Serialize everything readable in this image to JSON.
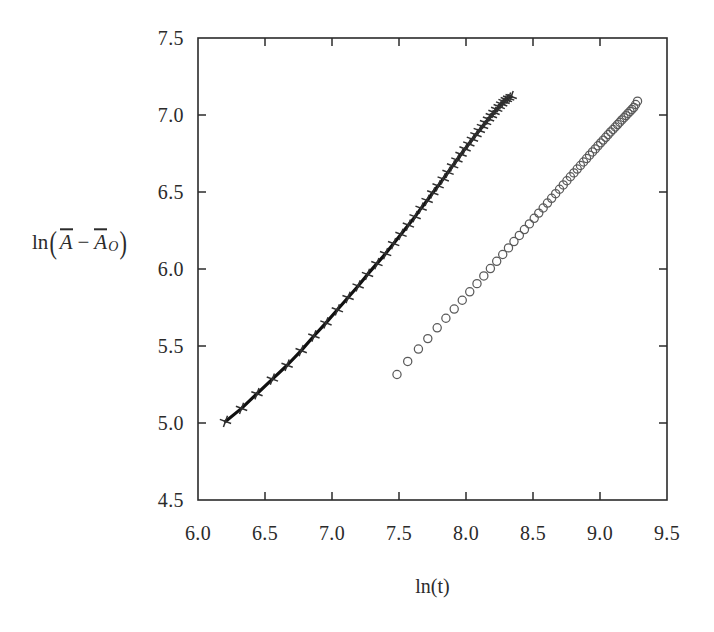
{
  "axis_labels": {
    "x_title": "ln(t)",
    "y_title_parts": {
      "fn": "ln",
      "open": "(",
      "var1": "A",
      "operator": "−",
      "var2": "A",
      "var2_sub": "O",
      "close": ")"
    },
    "y_title_plain": "ln(Ā − Ā_O)"
  },
  "chart_data": {
    "type": "scatter",
    "title": "",
    "xlabel": "ln(t)",
    "ylabel": "ln(Ā − Ā_O)",
    "xlim": [
      6.0,
      9.5
    ],
    "ylim": [
      4.5,
      7.5
    ],
    "xticks": [
      6.0,
      6.5,
      7.0,
      7.5,
      8.0,
      8.5,
      9.0,
      9.5
    ],
    "yticks": [
      4.5,
      5.0,
      5.5,
      6.0,
      6.5,
      7.0,
      7.5
    ],
    "xtick_labels": [
      "6.0",
      "6.5",
      "7.0",
      "7.5",
      "8.0",
      "8.5",
      "9.0",
      "9.5"
    ],
    "ytick_labels": [
      "4.5",
      "5.0",
      "5.5",
      "6.0",
      "6.5",
      "7.0",
      "7.5"
    ],
    "grid": false,
    "legend": "none",
    "frame": "box",
    "tick_direction": "in",
    "series": [
      {
        "name": "cross-series",
        "marker": "cross",
        "marker_color": "#303030",
        "line": "solid",
        "line_color": "#101010",
        "line_width": 3.2,
        "x": [
          6.205,
          6.325,
          6.44,
          6.555,
          6.665,
          6.77,
          6.865,
          6.955,
          7.04,
          7.12,
          7.195,
          7.265,
          7.335,
          7.4,
          7.46,
          7.515,
          7.57,
          7.62,
          7.665,
          7.71,
          7.752,
          7.792,
          7.83,
          7.866,
          7.9,
          7.932,
          7.963,
          7.993,
          8.021,
          8.048,
          8.074,
          8.099,
          8.123,
          8.146,
          8.168,
          8.189,
          8.209,
          8.229,
          8.248,
          8.266,
          8.284,
          8.301,
          8.318,
          8.337
        ],
        "y": [
          5.01,
          5.095,
          5.19,
          5.285,
          5.375,
          5.47,
          5.565,
          5.65,
          5.735,
          5.815,
          5.89,
          5.965,
          6.035,
          6.1,
          6.165,
          6.225,
          6.285,
          6.34,
          6.395,
          6.445,
          6.495,
          6.54,
          6.585,
          6.628,
          6.67,
          6.708,
          6.745,
          6.78,
          6.812,
          6.843,
          6.872,
          6.9,
          6.926,
          6.951,
          6.974,
          6.996,
          7.017,
          7.037,
          7.055,
          7.072,
          7.088,
          7.1,
          7.11,
          7.12
        ]
      },
      {
        "name": "circle-series",
        "marker": "circle-open",
        "marker_color": "#5a5a5a",
        "line": "none",
        "marker_size": 8.2,
        "x": [
          7.485,
          7.565,
          7.645,
          7.715,
          7.785,
          7.85,
          7.912,
          7.972,
          8.028,
          8.082,
          8.133,
          8.182,
          8.229,
          8.274,
          8.317,
          8.358,
          8.398,
          8.436,
          8.473,
          8.509,
          8.543,
          8.576,
          8.608,
          8.639,
          8.669,
          8.698,
          8.726,
          8.753,
          8.779,
          8.805,
          8.83,
          8.854,
          8.877,
          8.9,
          8.922,
          8.944,
          8.965,
          8.985,
          9.005,
          9.024,
          9.043,
          9.061,
          9.079,
          9.097,
          9.114,
          9.131,
          9.147,
          9.163,
          9.179,
          9.194,
          9.209,
          9.224,
          9.238,
          9.252,
          9.266,
          9.28
        ],
        "y": [
          5.315,
          5.4,
          5.48,
          5.548,
          5.618,
          5.68,
          5.74,
          5.797,
          5.852,
          5.905,
          5.955,
          6.003,
          6.05,
          6.094,
          6.137,
          6.178,
          6.218,
          6.256,
          6.293,
          6.329,
          6.363,
          6.396,
          6.428,
          6.459,
          6.489,
          6.518,
          6.546,
          6.573,
          6.599,
          6.624,
          6.649,
          6.672,
          6.695,
          6.717,
          6.739,
          6.76,
          6.78,
          6.8,
          6.819,
          6.837,
          6.855,
          6.873,
          6.89,
          6.906,
          6.922,
          6.938,
          6.953,
          6.968,
          6.982,
          6.996,
          7.01,
          7.023,
          7.036,
          7.049,
          7.068,
          7.09
        ]
      }
    ]
  },
  "geometry": {
    "plot_left": 198,
    "plot_right": 667,
    "plot_top": 38,
    "plot_bottom": 500
  },
  "colors": {
    "frame": "#2b2b2b",
    "background": "#ffffff",
    "cross_line": "#101010",
    "circle_stroke": "#5a5a5a",
    "text": "#2b2b2b"
  }
}
